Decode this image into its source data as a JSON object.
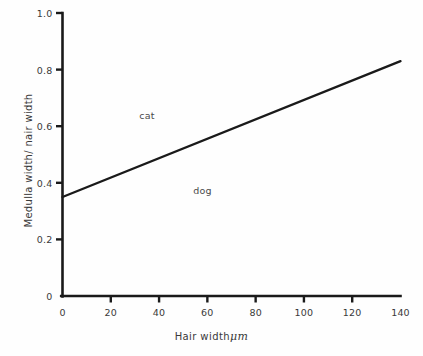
{
  "chart_data": {
    "type": "line",
    "title": "",
    "subtitle": "",
    "xlabel_text": "Hair width",
    "xlabel_unit": "μm",
    "xlabel": "Hair width μm",
    "ylabel": "Medulla width/ nair width",
    "xlim": [
      0,
      140
    ],
    "ylim": [
      0,
      1.0
    ],
    "grid": false,
    "legend_position": "inline-annotation",
    "xticks": [
      "0",
      "20",
      "40",
      "60",
      "80",
      "100",
      "120",
      "140"
    ],
    "xtick_values": [
      0,
      20,
      40,
      60,
      80,
      100,
      120,
      140
    ],
    "yticks": [
      "0",
      "0.2",
      "0.4",
      "0.6",
      "0.8",
      "1.0"
    ],
    "ytick_values": [
      0,
      0.2,
      0.4,
      0.6,
      0.8,
      1.0
    ],
    "series": [
      {
        "name": "cat/dog boundary",
        "x": [
          0,
          140
        ],
        "values": [
          0.35,
          0.83
        ],
        "color": "#1a1a1a"
      }
    ],
    "annotations": [
      {
        "label": "cat",
        "x": 35,
        "y": 0.64
      },
      {
        "label": "dog",
        "x": 58,
        "y": 0.375
      }
    ],
    "axis_color": "#1a1a1a",
    "text_color": "#3a3a3a",
    "background": "#fefefe"
  }
}
